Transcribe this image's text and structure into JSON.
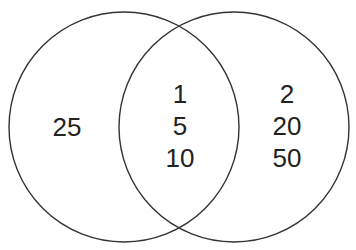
{
  "diagram": {
    "type": "venn",
    "stroke_color": "#333333",
    "background": "#ffffff",
    "sets": [
      {
        "name": "left-set",
        "cx": 124,
        "cy": 127,
        "r": 115
      },
      {
        "name": "right-set",
        "cx": 234,
        "cy": 127,
        "r": 115
      }
    ],
    "regions": {
      "left_only": {
        "values": [
          "25"
        ]
      },
      "intersection": {
        "values": [
          "1",
          "5",
          "10"
        ]
      },
      "right_only": {
        "values": [
          "2",
          "20",
          "50"
        ]
      }
    }
  }
}
